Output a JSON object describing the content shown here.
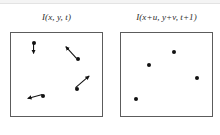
{
  "figure": {
    "type": "diagram",
    "background_color": "#ffffff",
    "ink_color": "#111111",
    "frame_border_color": "#5c5c5c",
    "canvas": {
      "width": 220,
      "height": 135
    }
  },
  "panels": [
    {
      "id": "frame-t",
      "label": "I(x, y, t)",
      "box": {
        "x": 10,
        "y": 32,
        "width": 93,
        "height": 85
      },
      "shows_motion_vectors": true,
      "points": [
        {
          "id": "p1",
          "x": 33,
          "y": 42,
          "u": 0,
          "v": -11,
          "arrow_label": "up"
        },
        {
          "id": "p2",
          "x": 77,
          "y": 58,
          "u": -11,
          "v": -12,
          "arrow_label": "up-left"
        },
        {
          "id": "p3",
          "x": 76,
          "y": 88,
          "u": 14,
          "v": -12,
          "arrow_label": "up-right"
        },
        {
          "id": "p4",
          "x": 42,
          "y": 95,
          "u": -15,
          "v": 4,
          "arrow_label": "left-down"
        }
      ]
    },
    {
      "id": "frame-t-plus-1",
      "label": "I(x+u, y+v, t+1)",
      "box": {
        "x": 120,
        "y": 32,
        "width": 93,
        "height": 85
      },
      "shows_motion_vectors": false,
      "points": [
        {
          "id": "q1",
          "x": 173,
          "y": 51
        },
        {
          "id": "q2",
          "x": 148,
          "y": 64
        },
        {
          "id": "q3",
          "x": 196,
          "y": 77
        },
        {
          "id": "q4",
          "x": 135,
          "y": 98
        }
      ]
    }
  ],
  "caption": {
    "text": "",
    "note": "caption clipped at bottom edge of screenshot"
  }
}
